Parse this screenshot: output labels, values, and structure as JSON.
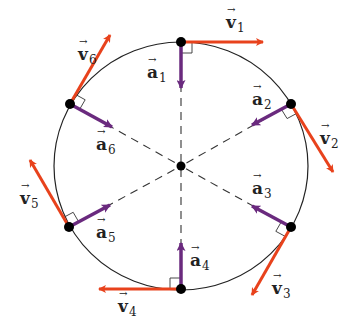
{
  "colors": {
    "velocity": "#e8421c",
    "acceleration": "#6a2a7e",
    "circle": "#222222",
    "point": "#000000",
    "dash": "#333333"
  },
  "circle": {
    "cx": 181,
    "cy": 166,
    "rx": 127,
    "ry": 124
  },
  "center_point": {
    "x": 181,
    "y": 166
  },
  "points": [
    {
      "id": 1,
      "x": 181,
      "y": 42
    },
    {
      "id": 2,
      "x": 291,
      "y": 104
    },
    {
      "id": 3,
      "x": 291,
      "y": 227
    },
    {
      "id": 4,
      "x": 181,
      "y": 289
    },
    {
      "id": 5,
      "x": 69,
      "y": 227
    },
    {
      "id": 6,
      "x": 70,
      "y": 104
    }
  ],
  "velocity_vectors": [
    {
      "id": 1,
      "from": [
        181,
        42
      ],
      "to": [
        263,
        42
      ]
    },
    {
      "id": 2,
      "from": [
        291,
        104
      ],
      "to": [
        333,
        172
      ]
    },
    {
      "id": 3,
      "from": [
        291,
        227
      ],
      "to": [
        252,
        295
      ]
    },
    {
      "id": 4,
      "from": [
        181,
        289
      ],
      "to": [
        99,
        289
      ]
    },
    {
      "id": 5,
      "from": [
        69,
        227
      ],
      "to": [
        30,
        160
      ]
    },
    {
      "id": 6,
      "from": [
        70,
        104
      ],
      "to": [
        110,
        35
      ]
    }
  ],
  "acceleration_vectors": [
    {
      "id": 1,
      "from": [
        181,
        42
      ],
      "to": [
        181,
        88
      ]
    },
    {
      "id": 2,
      "from": [
        291,
        104
      ],
      "to": [
        252,
        125
      ]
    },
    {
      "id": 3,
      "from": [
        291,
        227
      ],
      "to": [
        252,
        206
      ]
    },
    {
      "id": 4,
      "from": [
        181,
        289
      ],
      "to": [
        181,
        243
      ]
    },
    {
      "id": 5,
      "from": [
        69,
        227
      ],
      "to": [
        110,
        205
      ]
    },
    {
      "id": 6,
      "from": [
        70,
        104
      ],
      "to": [
        112,
        127
      ]
    }
  ],
  "labels": {
    "v1": {
      "sym": "v",
      "sub": "1"
    },
    "v2": {
      "sym": "v",
      "sub": "2"
    },
    "v3": {
      "sym": "v",
      "sub": "3"
    },
    "v4": {
      "sym": "v",
      "sub": "4"
    },
    "v5": {
      "sym": "v",
      "sub": "5"
    },
    "v6": {
      "sym": "v",
      "sub": "6"
    },
    "a1": {
      "sym": "a",
      "sub": "1"
    },
    "a2": {
      "sym": "a",
      "sub": "2"
    },
    "a3": {
      "sym": "a",
      "sub": "3"
    },
    "a4": {
      "sym": "a",
      "sub": "4"
    },
    "a5": {
      "sym": "a",
      "sub": "5"
    },
    "a6": {
      "sym": "a",
      "sub": "6"
    }
  },
  "label_positions": {
    "v1": [
      226,
      14
    ],
    "v2": [
      320,
      130
    ],
    "v3": [
      272,
      280
    ],
    "v4": [
      118,
      298
    ],
    "v5": [
      20,
      190
    ],
    "v6": [
      78,
      46
    ],
    "a1": [
      147,
      64
    ],
    "a2": [
      252,
      91
    ],
    "a3": [
      252,
      180
    ],
    "a4": [
      190,
      252
    ],
    "a5": [
      96,
      224
    ],
    "a6": [
      96,
      136
    ]
  }
}
